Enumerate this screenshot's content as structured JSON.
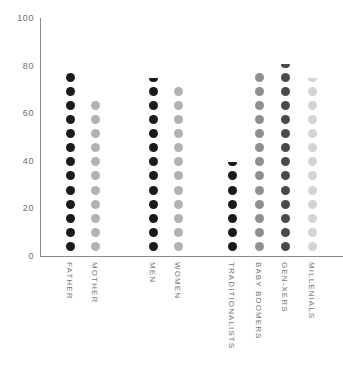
{
  "chart_data": {
    "type": "bar",
    "style": "dot-column / pictogram bar chart",
    "title": "",
    "subtitle": "",
    "xlabel": "",
    "ylabel": "",
    "ylim": [
      0,
      100
    ],
    "yticks": [
      0,
      20,
      40,
      60,
      80,
      100
    ],
    "ytick_labels": [
      "0",
      "20",
      "40",
      "60",
      "80",
      "100"
    ],
    "grid": false,
    "legend": "none",
    "dot_unit": 5.5,
    "categories": [
      "FATHER",
      "MOTHER",
      "MEN",
      "WOMEN",
      "TRADITIONALISTS",
      "BABY BOOMERS",
      "GEN-XERS",
      "MILLENIALS"
    ],
    "values": [
      72,
      61,
      71,
      66,
      34,
      72,
      75,
      70
    ],
    "groups": [
      {
        "name": "parents",
        "categories": [
          "FATHER",
          "MOTHER"
        ]
      },
      {
        "name": "gender",
        "categories": [
          "MEN",
          "WOMEN"
        ]
      },
      {
        "name": "generation",
        "categories": [
          "TRADITIONALISTS",
          "BABY BOOMERS",
          "GEN-XERS",
          "MILLENIALS"
        ]
      }
    ],
    "series": [
      {
        "name": "value",
        "points": [
          {
            "category": "FATHER",
            "value": 72,
            "dots": 13,
            "partial_top": false,
            "color": "#1a1a1a",
            "x": 70
          },
          {
            "category": "MOTHER",
            "value": 61,
            "dots": 11,
            "partial_top": false,
            "color": "#b2b2b2",
            "x": 95
          },
          {
            "category": "MEN",
            "value": 71,
            "dots": 12,
            "partial_top": true,
            "color": "#1a1a1a",
            "x": 153
          },
          {
            "category": "WOMEN",
            "value": 66,
            "dots": 12,
            "partial_top": false,
            "color": "#b2b2b2",
            "x": 178
          },
          {
            "category": "TRADITIONALISTS",
            "value": 34,
            "dots": 6,
            "partial_top": true,
            "color": "#1a1a1a",
            "x": 232
          },
          {
            "category": "BABY BOOMERS",
            "value": 72,
            "dots": 13,
            "partial_top": false,
            "color": "#8f8f8f",
            "x": 259
          },
          {
            "category": "GEN-XERS",
            "value": 75,
            "dots": 13,
            "partial_top": true,
            "color": "#4a4a4a",
            "x": 285
          },
          {
            "category": "MILLENIALS",
            "value": 70,
            "dots": 12,
            "partial_top": true,
            "color": "#d4d4d4",
            "x": 312
          }
        ]
      }
    ],
    "colors": {
      "axis": "#8a8a8a",
      "tick_text": "#6e6e6e",
      "label_text": "#767676",
      "background": "#ffffff",
      "dark": "#1a1a1a",
      "mid_dark": "#4a4a4a",
      "mid": "#8f8f8f",
      "light": "#b2b2b2",
      "lightest": "#d4d4d4"
    }
  }
}
